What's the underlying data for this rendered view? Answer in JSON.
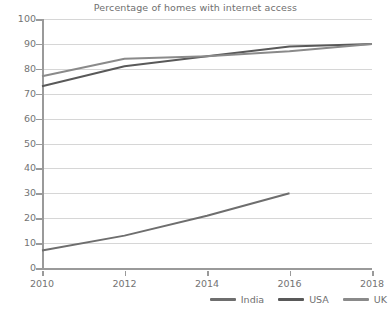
{
  "chart_data": {
    "type": "line",
    "title": "Percentage of homes with internet access",
    "xlabel": "",
    "ylabel": "",
    "xlim": [
      2010,
      2018
    ],
    "ylim": [
      0,
      100
    ],
    "grid": true,
    "legend_position": "bottom-right",
    "x": [
      2010,
      2012,
      2014,
      2016,
      2018
    ],
    "xtick_labels": [
      "2010",
      "2012",
      "2014",
      "2016",
      "2018"
    ],
    "ytick_labels": [
      "0",
      "10",
      "20",
      "30",
      "40",
      "50",
      "60",
      "70",
      "80",
      "90",
      "100"
    ],
    "ytick_values": [
      0,
      10,
      20,
      30,
      40,
      50,
      60,
      70,
      80,
      90,
      100
    ],
    "series": [
      {
        "name": "India",
        "color": "#6e6e6e",
        "x": [
          2010,
          2012,
          2014,
          2016
        ],
        "values": [
          7,
          13,
          21,
          30
        ]
      },
      {
        "name": "USA",
        "color": "#595959",
        "x": [
          2010,
          2012,
          2014,
          2016,
          2018
        ],
        "values": [
          73,
          81,
          85,
          89,
          90
        ]
      },
      {
        "name": "UK",
        "color": "#8a8a8a",
        "x": [
          2010,
          2012,
          2014,
          2016,
          2018
        ],
        "values": [
          77,
          84,
          85,
          87,
          90
        ]
      }
    ]
  },
  "legend": {
    "items": [
      {
        "label": "India",
        "color": "#6e6e6e"
      },
      {
        "label": "USA",
        "color": "#595959"
      },
      {
        "label": "UK",
        "color": "#8a8a8a"
      }
    ]
  }
}
